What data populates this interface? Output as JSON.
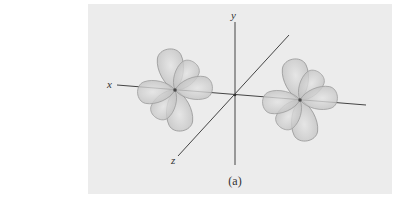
{
  "figure": {
    "caption": "(a)",
    "axes": {
      "x_label": "x",
      "y_label": "y",
      "z_label": "z"
    },
    "orbitals": [
      {
        "name": "left-d-orbital",
        "center": [
          175,
          90
        ]
      },
      {
        "name": "right-d-orbital",
        "center": [
          300,
          100
        ]
      }
    ],
    "colors": {
      "panel": "#ececec",
      "lobe_fill": "#c8c8c8",
      "lobe_stroke": "#9a9a9a",
      "axis": "#444444"
    }
  }
}
